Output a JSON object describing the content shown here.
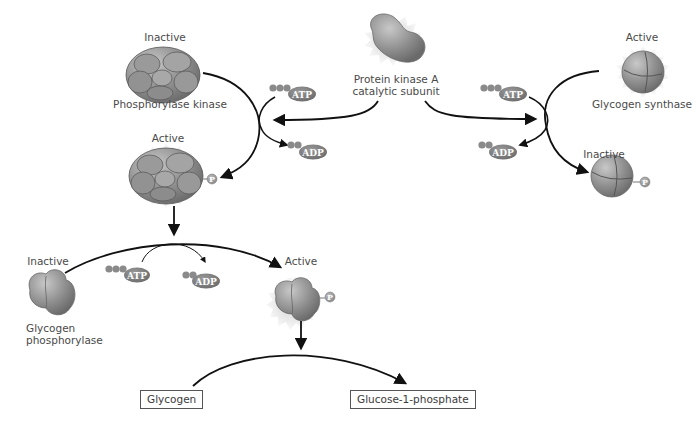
{
  "diagram": {
    "type": "signaling-pathway",
    "colors": {
      "protein": "#8a8a8a",
      "protein_dark": "#5e5e5e",
      "burst": "#ececec",
      "arrow": "#111111",
      "nucleotide": "#7a7a7a",
      "text": "#4a4a4a"
    },
    "center_enzyme": {
      "name_line1": "Protein kinase A",
      "name_line2": "catalytic subunit"
    },
    "phosphorylase_kinase": {
      "inactive_label": "Inactive",
      "name": "Phosphorylase kinase",
      "active_label": "Active"
    },
    "glycogen_synthase": {
      "active_label": "Active",
      "name": "Glycogen synthase",
      "inactive_label": "Inactive"
    },
    "glycogen_phosphorylase": {
      "inactive_label": "Inactive",
      "name_line1": "Glycogen",
      "name_line2": "phosphorylase",
      "active_label": "Active"
    },
    "nucleotides": {
      "atp": "ATP",
      "adp": "ADP",
      "phosphate": "P"
    },
    "products": {
      "substrate": "Glycogen",
      "product": "Glucose-1-phosphate"
    }
  }
}
